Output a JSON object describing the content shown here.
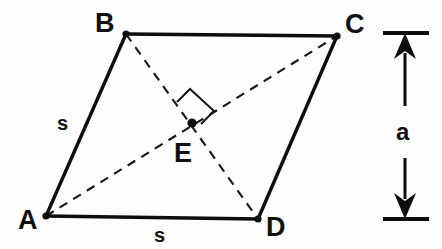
{
  "figure": {
    "background_color": "#fdfdfd",
    "stroke_color": "#0d0d0d",
    "dashed_color": "#161616"
  },
  "vertices": [
    {
      "id": "A",
      "label": "A",
      "x": 46,
      "y": 216,
      "label_x": 18,
      "label_y": 229
    },
    {
      "id": "B",
      "label": "B",
      "x": 126,
      "y": 34,
      "label_x": 95,
      "label_y": 32
    },
    {
      "id": "C",
      "label": "C",
      "x": 337,
      "y": 36,
      "label_x": 345,
      "label_y": 33
    },
    {
      "id": "D",
      "label": "D",
      "x": 258,
      "y": 219,
      "label_x": 266,
      "label_y": 236
    },
    {
      "id": "E",
      "label": "E",
      "x": 192,
      "y": 123,
      "label_x": 174,
      "label_y": 162
    }
  ],
  "edges": [
    {
      "name": "edge-AB",
      "from": "A",
      "to": "B",
      "style": "solid"
    },
    {
      "name": "edge-BC",
      "from": "B",
      "to": "C",
      "style": "solid"
    },
    {
      "name": "edge-CD",
      "from": "C",
      "to": "D",
      "style": "solid"
    },
    {
      "name": "edge-DA",
      "from": "D",
      "to": "A",
      "style": "solid"
    }
  ],
  "diagonals": [
    {
      "name": "diagonal-AC",
      "from": "A",
      "to": "C",
      "style": "dashed"
    },
    {
      "name": "diagonal-BD",
      "from": "B",
      "to": "D",
      "style": "dashed"
    }
  ],
  "side_labels": [
    {
      "name": "side-label-AB",
      "text": "s",
      "x": 57,
      "y": 130,
      "edge": "AB"
    },
    {
      "name": "side-label-AD",
      "text": "s",
      "x": 154,
      "y": 242,
      "edge": "AD"
    }
  ],
  "right_angle": {
    "name": "right-angle-marker",
    "present": true,
    "at_vertex": "E",
    "points": "177,102 190,89 214,111 201,124"
  },
  "dimension": {
    "name": "height-dimension",
    "label": "a",
    "label_x": 396,
    "label_y": 140,
    "axis_x": 405,
    "top_y": 33,
    "bottom_y": 219,
    "tick_left": 383,
    "tick_right": 429
  }
}
